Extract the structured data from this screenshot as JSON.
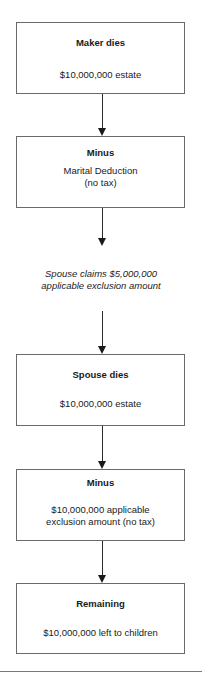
{
  "flowchart": {
    "steps": [
      {
        "title": "Maker dies",
        "body_lines": [
          "$10,000,000 estate"
        ]
      },
      {
        "title": "Minus",
        "body_lines": [
          "Marital Deduction",
          "(no tax)"
        ]
      },
      {
        "title": "Spouse dies",
        "body_lines": [
          "$10,000,000 estate"
        ]
      },
      {
        "title": "Minus",
        "body_lines": [
          "$10,000,000 applicable",
          "exclusion amount (no tax)"
        ]
      },
      {
        "title": "Remaining",
        "body_lines": [
          "$10,000,000 left to children"
        ]
      }
    ],
    "note_lines": [
      "Spouse claims $5,000,000",
      "applicable exclusion amount"
    ]
  },
  "colors": {
    "box_border": "#6a6a6a",
    "arrow": "#1a1a1a",
    "text": "#1a1a1a"
  }
}
